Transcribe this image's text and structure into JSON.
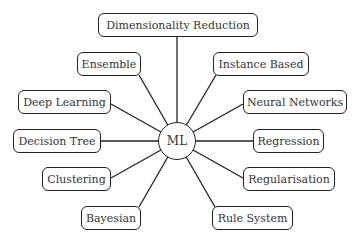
{
  "diagram": {
    "type": "mind-map",
    "center": {
      "label": "ML",
      "x": 177,
      "y": 141,
      "r": 19
    },
    "nodes": [
      {
        "id": "dimensionality-reduction",
        "label": "Dimensionality Reduction",
        "x": 98,
        "y": 13,
        "w": 160,
        "h": 24,
        "ax": 177,
        "ay": 37
      },
      {
        "id": "ensemble",
        "label": "Ensemble",
        "x": 77,
        "y": 52,
        "w": 64,
        "h": 24,
        "ax": 139,
        "ay": 75
      },
      {
        "id": "instance-based",
        "label": "Instance Based",
        "x": 213,
        "y": 52,
        "w": 96,
        "h": 24,
        "ax": 216,
        "ay": 75
      },
      {
        "id": "deep-learning",
        "label": "Deep Learning",
        "x": 18,
        "y": 90,
        "w": 93,
        "h": 24,
        "ax": 111,
        "ay": 104
      },
      {
        "id": "neural-networks",
        "label": "Neural Networks",
        "x": 243,
        "y": 90,
        "w": 104,
        "h": 24,
        "ax": 243,
        "ay": 104
      },
      {
        "id": "decision-tree",
        "label": "Decision Tree",
        "x": 13,
        "y": 129,
        "w": 88,
        "h": 24,
        "ax": 101,
        "ay": 141
      },
      {
        "id": "regression",
        "label": "Regression",
        "x": 253,
        "y": 129,
        "w": 71,
        "h": 24,
        "ax": 253,
        "ay": 141
      },
      {
        "id": "clustering",
        "label": "Clustering",
        "x": 42,
        "y": 167,
        "w": 69,
        "h": 24,
        "ax": 111,
        "ay": 178
      },
      {
        "id": "regularisation",
        "label": "Regularisation",
        "x": 243,
        "y": 167,
        "w": 92,
        "h": 24,
        "ax": 243,
        "ay": 178
      },
      {
        "id": "bayesian",
        "label": "Bayesian",
        "x": 81,
        "y": 206,
        "w": 60,
        "h": 24,
        "ax": 139,
        "ay": 207
      },
      {
        "id": "rule-system",
        "label": "Rule System",
        "x": 212,
        "y": 206,
        "w": 81,
        "h": 24,
        "ax": 215,
        "ay": 207
      }
    ]
  }
}
